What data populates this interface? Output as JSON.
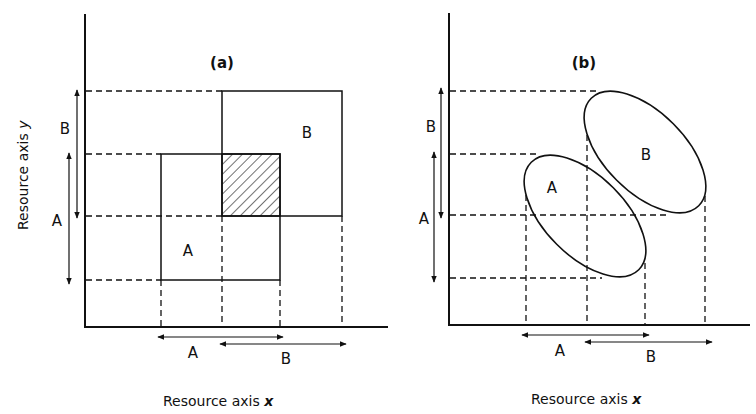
{
  "figure": {
    "panels": [
      {
        "id": "a",
        "title": "(a)",
        "shape": "rectangle",
        "x_axis_label": "Resource axis",
        "x_axis_var": "x",
        "y_axis_label": "Resource axis",
        "y_axis_var": "y",
        "species": [
          {
            "name": "A",
            "label": "A"
          },
          {
            "name": "B",
            "label": "B"
          }
        ],
        "range_labels": {
          "x_A": "A",
          "x_B": "B",
          "y_A": "A",
          "y_B": "B"
        },
        "overlap": "hatched"
      },
      {
        "id": "b",
        "title": "(b)",
        "shape": "ellipse",
        "x_axis_label": "Resource axis",
        "x_axis_var": "x",
        "y_axis_label": "",
        "y_axis_var": "",
        "species": [
          {
            "name": "A",
            "label": "A"
          },
          {
            "name": "B",
            "label": "B"
          }
        ],
        "range_labels": {
          "x_A": "A",
          "x_B": "B",
          "y_A": "A",
          "y_B": "B"
        },
        "overlap": "none"
      }
    ],
    "colors": {
      "ink": "#111111",
      "background": "#ffffff"
    }
  }
}
